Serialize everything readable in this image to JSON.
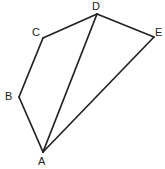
{
  "figure": {
    "width": 165,
    "height": 169,
    "background_color": "#ffffff",
    "stroke_color": "#222222",
    "stroke_width": 1.7,
    "label_color": "#222222",
    "label_font_size": 11
  },
  "chart_data": {
    "type": "diagram",
    "subtype": "polygon-geometry",
    "title": "",
    "vertices": [
      {
        "id": "A",
        "label": "A",
        "x": 43,
        "y": 152,
        "label_x": 38,
        "label_y": 156
      },
      {
        "id": "B",
        "label": "B",
        "x": 19,
        "y": 97,
        "label_x": 5,
        "label_y": 91
      },
      {
        "id": "C",
        "label": "C",
        "x": 43,
        "y": 38,
        "label_x": 32,
        "label_y": 27
      },
      {
        "id": "D",
        "label": "D",
        "x": 97,
        "y": 14,
        "label_x": 92,
        "label_y": 1
      },
      {
        "id": "E",
        "label": "E",
        "x": 154,
        "y": 37,
        "label_x": 155,
        "label_y": 27
      }
    ],
    "edges": [
      {
        "from": "C",
        "to": "D",
        "kind": "outline"
      },
      {
        "from": "D",
        "to": "E",
        "kind": "outline"
      },
      {
        "from": "E",
        "to": "A",
        "kind": "outline"
      },
      {
        "from": "A",
        "to": "B",
        "kind": "outline"
      },
      {
        "from": "B",
        "to": "C",
        "kind": "outline"
      },
      {
        "from": "D",
        "to": "A",
        "kind": "diagonal"
      }
    ]
  }
}
